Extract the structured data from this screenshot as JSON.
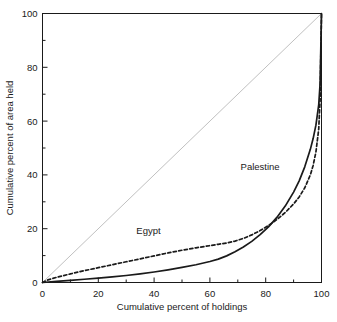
{
  "chart_data": {
    "type": "line",
    "title": "",
    "subtitle": "",
    "xlabel": "Cumulative percent of holdings",
    "ylabel": "Cumulative percent of area held",
    "xlim": [
      0,
      100
    ],
    "ylim": [
      0,
      100
    ],
    "grid": false,
    "legend_position": "inline-annotation",
    "x_ticks_major": [
      0,
      20,
      40,
      60,
      80,
      100
    ],
    "x_ticks_minor": [
      10,
      30,
      50,
      70,
      90
    ],
    "y_ticks_major": [
      0,
      20,
      40,
      60,
      80,
      100
    ],
    "y_ticks_minor": [
      10,
      30,
      50,
      70,
      90
    ],
    "x_tick_labels": [
      "0",
      "20",
      "40",
      "60",
      "80",
      "100"
    ],
    "y_tick_labels": [
      "0",
      "20",
      "40",
      "60",
      "80",
      "100"
    ],
    "reference_line": {
      "name": "line-of-equality",
      "x": [
        0,
        100
      ],
      "y": [
        0,
        100
      ],
      "style": "solid",
      "color": "#b0b0b0",
      "width": 0.8
    },
    "series": [
      {
        "name": "Palestine",
        "style": "solid",
        "color": "#1a1a1a",
        "width": 1.7,
        "annotation": "Palestine",
        "annotation_x": 78,
        "annotation_y": 42,
        "x": [
          0,
          5,
          10,
          15,
          20,
          25,
          30,
          35,
          40,
          45,
          50,
          55,
          60,
          63,
          66,
          69,
          72,
          75,
          78,
          81,
          84,
          87,
          90,
          92,
          94,
          96,
          97,
          98,
          99,
          99.5,
          100
        ],
        "y": [
          0,
          0.4,
          0.8,
          1.2,
          1.6,
          2.1,
          2.6,
          3.2,
          3.9,
          4.7,
          5.6,
          6.6,
          7.8,
          8.7,
          9.9,
          11.4,
          13.2,
          15.3,
          17.8,
          20.7,
          24.2,
          28.4,
          33.6,
          37.8,
          43.0,
          49.5,
          53.5,
          58.5,
          66.0,
          74.0,
          100
        ]
      },
      {
        "name": "Egypt",
        "style": "dashed",
        "color": "#1a1a1a",
        "width": 1.7,
        "annotation": "Egypt",
        "annotation_x": 38,
        "annotation_y": 18,
        "x": [
          0,
          2,
          5,
          10,
          15,
          20,
          25,
          30,
          35,
          40,
          45,
          50,
          55,
          60,
          63,
          66,
          69,
          72,
          75,
          78,
          81,
          84,
          87,
          90,
          92,
          94,
          96,
          97,
          98,
          99,
          99.5,
          100
        ],
        "y": [
          0,
          1.0,
          1.9,
          3.2,
          4.4,
          5.5,
          6.6,
          7.7,
          8.8,
          9.9,
          11.0,
          12.0,
          12.9,
          13.7,
          14.2,
          14.7,
          15.4,
          16.4,
          17.7,
          19.3,
          21.2,
          23.4,
          26.0,
          29.2,
          31.8,
          35.2,
          40.0,
          43.5,
          48.5,
          57.0,
          68.0,
          100
        ]
      }
    ]
  },
  "axes": {
    "x_title": "Cumulative percent of holdings",
    "y_title": "Cumulative percent of area held"
  },
  "colors": {
    "frame": "#1a1a1a",
    "curve": "#1a1a1a",
    "diagonal": "#b0b0b0",
    "background": "#ffffff"
  }
}
